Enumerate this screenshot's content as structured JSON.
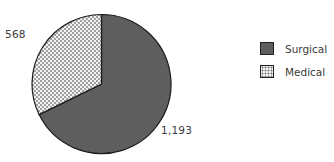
{
  "chart_data": {
    "type": "pie",
    "title": "",
    "categories": [
      "Surgical",
      "Medical"
    ],
    "values": [
      1193,
      568
    ],
    "value_labels": [
      "1,193",
      "568"
    ],
    "colors": {
      "Surgical": "#5e5e5e",
      "Medical": "dotted-pattern"
    },
    "legend_position": "right",
    "start_angle": "12 o'clock",
    "direction": "clockwise"
  },
  "labels": {
    "surgical": "1,193",
    "medical": "568"
  },
  "legend": {
    "surgical": "Surgical",
    "medical": "Medical"
  }
}
